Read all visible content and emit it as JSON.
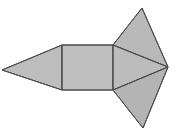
{
  "figure": {
    "kind": "geometric-net-diagram",
    "canvas": {
      "width": 181,
      "height": 137,
      "background": "#ffffff"
    },
    "style": {
      "fill_light": "#c2c2c2",
      "fill_mid": "#b7b7b7",
      "fill_dark": "#ababab",
      "stroke": "#4a4a4a",
      "stroke_width": 1
    },
    "vertices": {
      "left_apex": "2,70",
      "rect_top_left": "62,45",
      "rect_bottom_left": "62,90",
      "rect_top_right": "113,45",
      "rect_bottom_right": "113,90",
      "top_apex": "142,8",
      "bottom_apex": "143,128",
      "right_point": "168,67"
    },
    "faces": [
      {
        "name": "left-triangle",
        "label": "left wing triangle",
        "points": "2,70 62,45 62,90",
        "fill": "#bdbdbd"
      },
      {
        "name": "center-rectangle",
        "label": "central rectangle",
        "points": "62,45 113,45 113,90 62,90",
        "fill": "#c0c0c0"
      },
      {
        "name": "upper-right-triangle",
        "label": "upper right triangle",
        "points": "113,45 142,8 168,67",
        "fill": "#b9b9b9"
      },
      {
        "name": "middle-right-triangle",
        "label": "middle right triangle",
        "points": "113,45 168,67 113,90",
        "fill": "#bcbcbc"
      },
      {
        "name": "lower-right-triangle",
        "label": "lower right triangle",
        "points": "113,90 168,67 143,128",
        "fill": "#b4b4b4"
      }
    ],
    "edges": [
      {
        "name": "edge-left-upper",
        "from": "2,70",
        "to": "62,45"
      },
      {
        "name": "edge-left-lower",
        "from": "2,70",
        "to": "62,90"
      },
      {
        "name": "edge-rect-left",
        "from": "62,45",
        "to": "62,90"
      },
      {
        "name": "edge-rect-top",
        "from": "62,45",
        "to": "113,45"
      },
      {
        "name": "edge-rect-bottom",
        "from": "62,90",
        "to": "113,90"
      },
      {
        "name": "edge-rect-right",
        "from": "113,45",
        "to": "113,90"
      },
      {
        "name": "edge-top-apex-left",
        "from": "113,45",
        "to": "142,8"
      },
      {
        "name": "edge-top-apex-right",
        "from": "142,8",
        "to": "168,67"
      },
      {
        "name": "edge-fold-upper",
        "from": "113,45",
        "to": "168,67"
      },
      {
        "name": "edge-fold-lower",
        "from": "113,90",
        "to": "168,67"
      },
      {
        "name": "edge-bottom-apex-right",
        "from": "168,67",
        "to": "143,128"
      },
      {
        "name": "edge-bottom-apex-left",
        "from": "143,128",
        "to": "113,90"
      }
    ],
    "labels": []
  }
}
